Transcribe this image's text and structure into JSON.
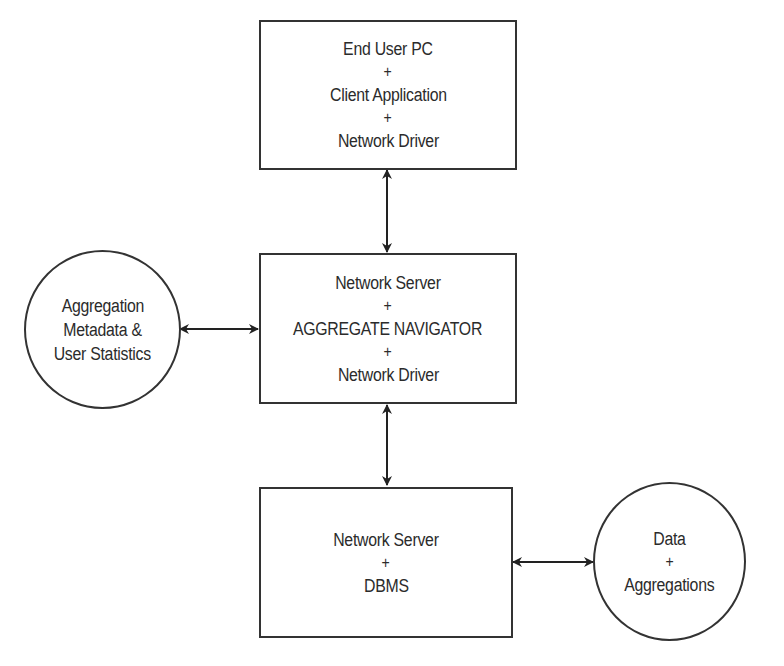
{
  "diagram": {
    "nodes": [
      {
        "id": "end-user-pc",
        "shape": "rectangle",
        "lines": [
          "End User PC",
          "+",
          "Client Application",
          "+",
          "Network Driver"
        ]
      },
      {
        "id": "aggregate-navigator-server",
        "shape": "rectangle",
        "lines": [
          "Network Server",
          "+",
          "AGGREGATE NAVIGATOR",
          "+",
          "Network Driver"
        ]
      },
      {
        "id": "dbms-server",
        "shape": "rectangle",
        "lines": [
          "Network Server",
          "+",
          "DBMS"
        ]
      },
      {
        "id": "aggregation-metadata",
        "shape": "circle",
        "lines": [
          "Aggregation",
          "Metadata &",
          "User Statistics"
        ]
      },
      {
        "id": "data-aggregations",
        "shape": "circle",
        "lines": [
          "Data",
          "+",
          "Aggregations"
        ]
      }
    ],
    "edges": [
      {
        "from": "end-user-pc",
        "to": "aggregate-navigator-server",
        "type": "bidirectional"
      },
      {
        "from": "aggregation-metadata",
        "to": "aggregate-navigator-server",
        "type": "bidirectional"
      },
      {
        "from": "aggregate-navigator-server",
        "to": "dbms-server",
        "type": "bidirectional"
      },
      {
        "from": "dbms-server",
        "to": "data-aggregations",
        "type": "bidirectional"
      }
    ]
  }
}
